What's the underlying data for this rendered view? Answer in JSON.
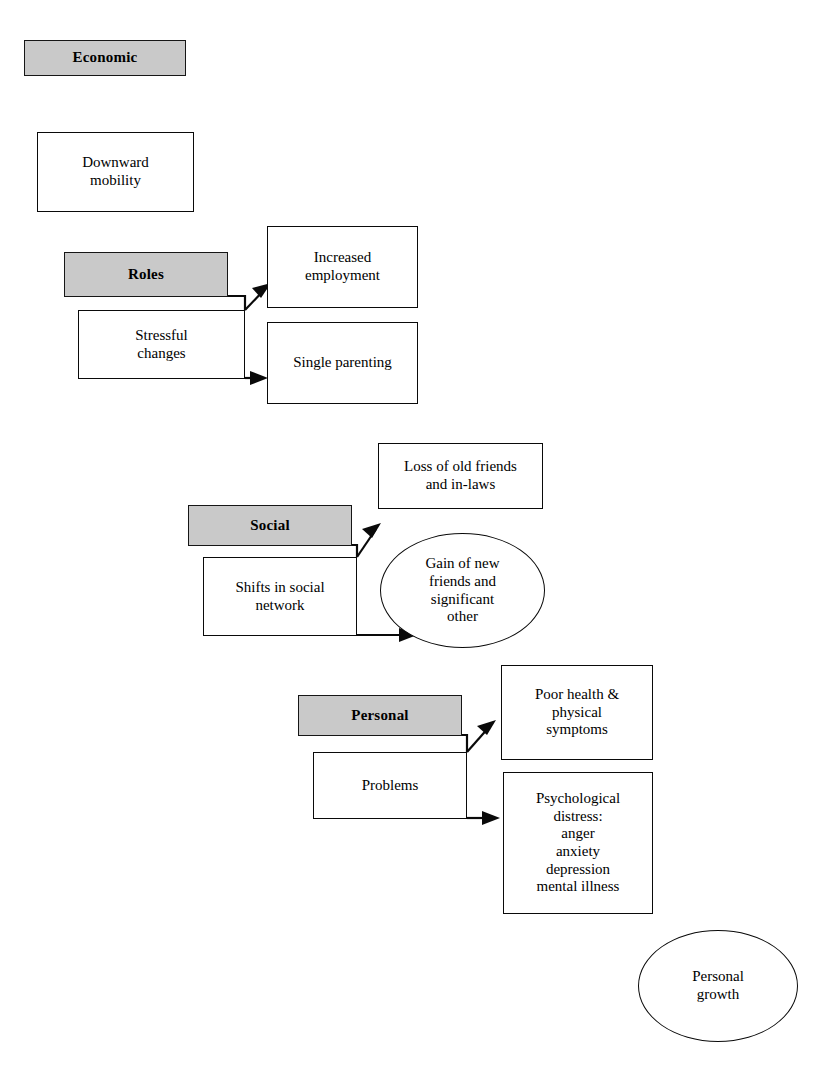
{
  "diagram": {
    "background_color": "#ffffff",
    "header_fill_color": "#c9c9c9",
    "line_color": "#0a0a0a",
    "groups": [
      {
        "id": "economic",
        "header": "Economic",
        "outcomes": [
          "Downward\nmobility"
        ]
      },
      {
        "id": "roles",
        "header": "Roles",
        "cause": "Stressful\nchanges",
        "outcomes": [
          "Increased\nemployment",
          "Single parenting"
        ]
      },
      {
        "id": "social",
        "header": "Social",
        "cause": "Shifts in social\nnetwork",
        "outcomes": [
          "Loss of old friends\nand in-laws",
          "Gain of new\nfriends and\nsignificant\nother"
        ]
      },
      {
        "id": "personal",
        "header": "Personal",
        "cause": "Problems",
        "outcomes": [
          "Poor health &\nphysical\nsymptoms",
          "Psychological\ndistress:\nanger\nanxiety\ndepression\nmental illness",
          "Personal\ngrowth"
        ]
      }
    ]
  },
  "nodes": {
    "economic_header": "Economic",
    "downward_mobility": "Downward\nmobility",
    "roles_header": "Roles",
    "stressful_changes": "Stressful\nchanges",
    "increased_employment": "Increased\nemployment",
    "single_parenting": "Single parenting",
    "social_header": "Social",
    "shifts_in_social_network": "Shifts in social\nnetwork",
    "loss_of_old_friends": "Loss of old friends\nand in-laws",
    "gain_of_new_friends": "Gain of new\nfriends and\nsignificant\nother",
    "personal_header": "Personal",
    "problems": "Problems",
    "poor_health": "Poor health &\nphysical\nsymptoms",
    "psychological_distress": "Psychological\ndistress:\nanger\nanxiety\ndepression\nmental illness",
    "personal_growth": "Personal\ngrowth"
  }
}
